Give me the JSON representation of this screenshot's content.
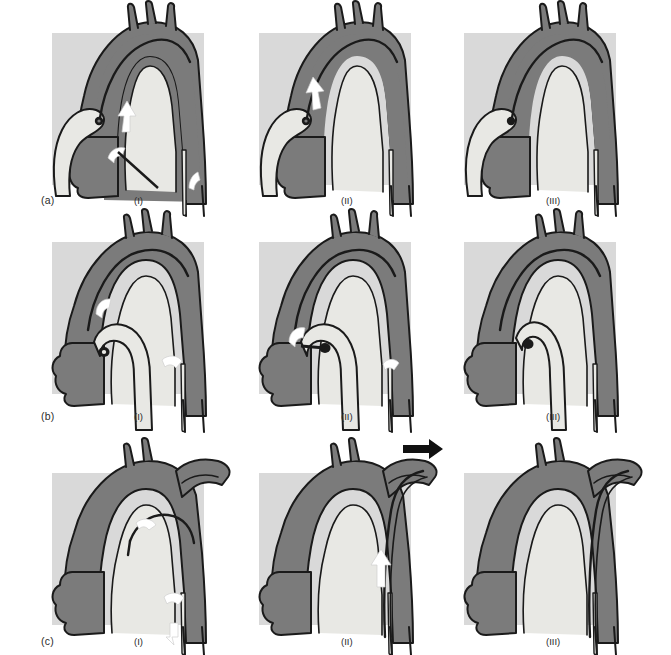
{
  "figure": {
    "grid": {
      "rows": 3,
      "columns": 3
    },
    "colors": {
      "page_background": "#ffffff",
      "panel_background": "#d9d9d9",
      "vessel_fill": "#7b7b7b",
      "lumen_fill": "#e8e8e4",
      "graft_fill": "#e8e8e4",
      "outline": "#1a1a1a",
      "highlight_arrow": "#ffffff",
      "dark_arrow": "#111111",
      "label_text": "#2b2b2b"
    },
    "rows": [
      {
        "id": "a",
        "label": "(a)",
        "panels": [
          {
            "label": "(I)",
            "name": "panel-a-i",
            "stage": "Dissected aortic arch with entry tear; false lumen flow indicated",
            "arrows": [
              "white-arrow-ascending-aorta",
              "white-arrow-entry-tear",
              "white-arrow-descending-aorta"
            ],
            "has_graft": false,
            "has_side_branch": false,
            "has_dark_arrow": false
          },
          {
            "label": "(II)",
            "name": "panel-a-ii",
            "stage": "Proximal arch repaired; remaining flow through upper dissection",
            "arrows": [
              "white-arrow-upper-arch"
            ],
            "has_graft": false,
            "has_side_branch": false,
            "has_dark_arrow": false
          },
          {
            "label": "(III)",
            "name": "panel-a-iii",
            "stage": "Completed repair; dissection flap thrombosed",
            "arrows": [],
            "has_graft": false,
            "has_side_branch": false,
            "has_dark_arrow": false
          }
        ]
      },
      {
        "id": "b",
        "label": "(b)",
        "panels": [
          {
            "label": "(I)",
            "name": "panel-b-i",
            "stage": "Elephant trunk graft placed into descending aorta",
            "arrows": [
              "white-arrow-proximal-arch",
              "white-arrow-descending-aorta"
            ],
            "has_graft": true,
            "has_side_branch": false,
            "has_dark_arrow": false
          },
          {
            "label": "(II)",
            "name": "panel-b-ii",
            "stage": "Graft anastomosed proximally; residual false-lumen flow",
            "arrows": [
              "white-arrow-anastomosis",
              "white-arrow-descending-aorta"
            ],
            "has_graft": true,
            "has_side_branch": false,
            "has_dark_arrow": false
          },
          {
            "label": "(III)",
            "name": "panel-b-iii",
            "stage": "Graft fully incorporated; repair complete",
            "arrows": [],
            "has_graft": true,
            "has_side_branch": false,
            "has_dark_arrow": false
          }
        ]
      },
      {
        "id": "c",
        "label": "(c)",
        "panels": [
          {
            "label": "(I)",
            "name": "panel-c-i",
            "stage": "Dissection extending into a side branch; retrograde flow shown",
            "arrows": [
              "white-arrow-arch-tear",
              "white-arrow-descending-mid",
              "white-arrow-descending-lower"
            ],
            "has_graft": false,
            "has_side_branch": true,
            "has_dark_arrow": false
          },
          {
            "label": "(II)",
            "name": "panel-c-ii",
            "stage": "Stent-graft advanced antegrade; side-branch flow restored",
            "arrows": [
              "white-arrow-ascending-flow"
            ],
            "has_graft": false,
            "has_side_branch": true,
            "has_dark_arrow": true
          },
          {
            "label": "(III)",
            "name": "panel-c-iii",
            "stage": "Final result with patent side branch and sealed false lumen",
            "arrows": [],
            "has_graft": false,
            "has_side_branch": true,
            "has_dark_arrow": false
          }
        ]
      }
    ]
  }
}
